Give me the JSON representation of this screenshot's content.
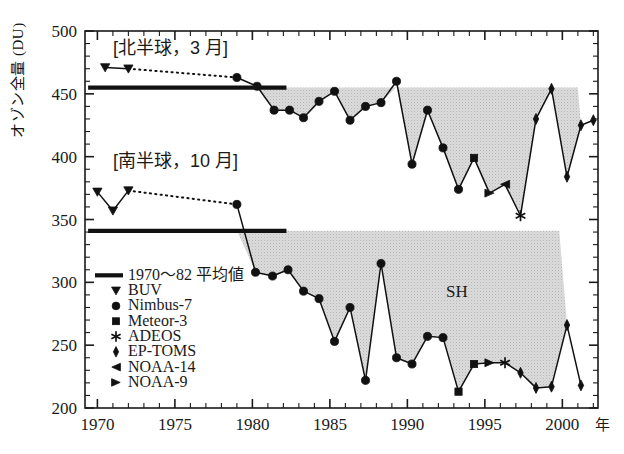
{
  "chart_data": {
    "type": "line",
    "title": "",
    "xlabel": "年",
    "ylabel": "オゾン全量 (DU)",
    "xlim": [
      1969.2,
      2002.3
    ],
    "ylim": [
      200,
      500
    ],
    "yticks": [
      200,
      250,
      300,
      350,
      400,
      450,
      500
    ],
    "xticks": [
      1970,
      1975,
      1980,
      1985,
      1990,
      1995,
      2000
    ],
    "xtick_labels": [
      "1970",
      "1975",
      "1980",
      "1985",
      "1990",
      "1995",
      "2000"
    ],
    "grid": false,
    "legend_position": "left-middle",
    "annotations": [
      {
        "text": "[北半球，3 月]",
        "x": 1971.0,
        "y": 482
      },
      {
        "text": "[南半球，10 月]",
        "x": 1971.0,
        "y": 392
      },
      {
        "text": "SH",
        "x": 1993.2,
        "y": 288
      }
    ],
    "reference_lines": [
      {
        "name": "NH 1970-82 mean",
        "y": 455,
        "x_start": 1969.4,
        "x_end": 1982.2
      },
      {
        "name": "SH 1970-82 mean",
        "y": 341,
        "x_start": 1969.4,
        "x_end": 1982.2
      }
    ],
    "shaded_regions": [
      {
        "name": "NH deficit",
        "baseline": 455,
        "x_start": 1980.3,
        "x_end": 2001.0
      },
      {
        "name": "SH deficit",
        "baseline": 341,
        "x_start": 1979.6,
        "x_end": 1999.8
      }
    ],
    "series": [
      {
        "name": "北半球 3月 (Northern Hemisphere, March)",
        "dotted_gap": true,
        "points": [
          {
            "x": 1970.5,
            "y": 471,
            "inst": "BUV"
          },
          {
            "x": 1972.0,
            "y": 470,
            "inst": "BUV"
          },
          {
            "x": 1979.0,
            "y": 463,
            "inst": "Nimbus-7"
          },
          {
            "x": 1980.3,
            "y": 456,
            "inst": "Nimbus-7"
          },
          {
            "x": 1981.4,
            "y": 437,
            "inst": "Nimbus-7"
          },
          {
            "x": 1982.4,
            "y": 437,
            "inst": "Nimbus-7"
          },
          {
            "x": 1983.3,
            "y": 431,
            "inst": "Nimbus-7"
          },
          {
            "x": 1984.3,
            "y": 444,
            "inst": "Nimbus-7"
          },
          {
            "x": 1985.3,
            "y": 452,
            "inst": "Nimbus-7"
          },
          {
            "x": 1986.3,
            "y": 429,
            "inst": "Nimbus-7"
          },
          {
            "x": 1987.3,
            "y": 440,
            "inst": "Nimbus-7"
          },
          {
            "x": 1988.3,
            "y": 443,
            "inst": "Nimbus-7"
          },
          {
            "x": 1989.3,
            "y": 460,
            "inst": "Nimbus-7"
          },
          {
            "x": 1990.3,
            "y": 394,
            "inst": "Nimbus-7"
          },
          {
            "x": 1991.3,
            "y": 437,
            "inst": "Nimbus-7"
          },
          {
            "x": 1992.3,
            "y": 407,
            "inst": "Nimbus-7"
          },
          {
            "x": 1993.3,
            "y": 374,
            "inst": "Nimbus-7"
          },
          {
            "x": 1994.3,
            "y": 399,
            "inst": "Meteor-3"
          },
          {
            "x": 1995.3,
            "y": 371,
            "inst": "NOAA-9"
          },
          {
            "x": 1996.3,
            "y": 378,
            "inst": "NOAA-14"
          },
          {
            "x": 1997.3,
            "y": 353,
            "inst": "ADEOS"
          },
          {
            "x": 1998.3,
            "y": 430,
            "inst": "EP-TOMS"
          },
          {
            "x": 1999.3,
            "y": 454,
            "inst": "EP-TOMS"
          },
          {
            "x": 2000.3,
            "y": 384,
            "inst": "EP-TOMS"
          },
          {
            "x": 2001.2,
            "y": 425,
            "inst": "EP-TOMS"
          },
          {
            "x": 2002.0,
            "y": 429,
            "inst": "EP-TOMS"
          }
        ]
      },
      {
        "name": "南半球 10月 (Southern Hemisphere, October)",
        "dotted_gap": true,
        "points": [
          {
            "x": 1970.0,
            "y": 372,
            "inst": "BUV"
          },
          {
            "x": 1971.0,
            "y": 357,
            "inst": "BUV"
          },
          {
            "x": 1972.0,
            "y": 373,
            "inst": "BUV"
          },
          {
            "x": 1979.0,
            "y": 362,
            "inst": "Nimbus-7"
          },
          {
            "x": 1980.2,
            "y": 308,
            "inst": "Nimbus-7"
          },
          {
            "x": 1981.3,
            "y": 305,
            "inst": "Nimbus-7"
          },
          {
            "x": 1982.3,
            "y": 310,
            "inst": "Nimbus-7"
          },
          {
            "x": 1983.3,
            "y": 293,
            "inst": "Nimbus-7"
          },
          {
            "x": 1984.3,
            "y": 287,
            "inst": "Nimbus-7"
          },
          {
            "x": 1985.3,
            "y": 253,
            "inst": "Nimbus-7"
          },
          {
            "x": 1986.3,
            "y": 280,
            "inst": "Nimbus-7"
          },
          {
            "x": 1987.3,
            "y": 222,
            "inst": "Nimbus-7"
          },
          {
            "x": 1988.3,
            "y": 315,
            "inst": "Nimbus-7"
          },
          {
            "x": 1989.3,
            "y": 240,
            "inst": "Nimbus-7"
          },
          {
            "x": 1990.3,
            "y": 235,
            "inst": "Nimbus-7"
          },
          {
            "x": 1991.3,
            "y": 257,
            "inst": "Nimbus-7"
          },
          {
            "x": 1992.3,
            "y": 256,
            "inst": "Nimbus-7"
          },
          {
            "x": 1993.3,
            "y": 213,
            "inst": "Meteor-3"
          },
          {
            "x": 1994.3,
            "y": 235,
            "inst": "Meteor-3"
          },
          {
            "x": 1995.3,
            "y": 236,
            "inst": "NOAA-9"
          },
          {
            "x": 1996.3,
            "y": 236,
            "inst": "ADEOS"
          },
          {
            "x": 1997.3,
            "y": 228,
            "inst": "EP-TOMS"
          },
          {
            "x": 1998.3,
            "y": 216,
            "inst": "EP-TOMS"
          },
          {
            "x": 1999.3,
            "y": 217,
            "inst": "EP-TOMS"
          },
          {
            "x": 2000.3,
            "y": 266,
            "inst": "EP-TOMS"
          },
          {
            "x": 2001.2,
            "y": 218,
            "inst": "EP-TOMS"
          }
        ]
      }
    ],
    "legend": [
      {
        "marker": "line",
        "label": "1970〜82 平均値"
      },
      {
        "marker": "triangle-down",
        "label": "BUV"
      },
      {
        "marker": "circle",
        "label": "Nimbus-7"
      },
      {
        "marker": "square",
        "label": "Meteor-3"
      },
      {
        "marker": "star",
        "label": "ADEOS"
      },
      {
        "marker": "diamond",
        "label": "EP-TOMS"
      },
      {
        "marker": "triangle-left",
        "label": "NOAA-14"
      },
      {
        "marker": "triangle-right",
        "label": "NOAA-9"
      }
    ]
  },
  "colors": {
    "axis": "#1a1a1a",
    "data": "#111111",
    "shade": "#d7d7d7",
    "background": "#ffffff"
  }
}
